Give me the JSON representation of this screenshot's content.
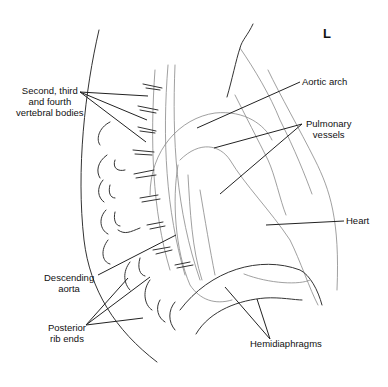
{
  "diagram": {
    "orientation_marker": "L",
    "labels": {
      "vertebral_bodies": [
        "Second, third",
        "and fourth",
        "vertebral bodies"
      ],
      "aortic_arch": "Aortic arch",
      "pulmonary_vessels": [
        "Pulmonary",
        "vessels"
      ],
      "heart": "Heart",
      "descending_aorta": [
        "Descending",
        "aorta"
      ],
      "posterior_rib_ends": [
        "Posterior",
        "rib ends"
      ],
      "hemidiaphragms": "Hemidiaphragms"
    }
  }
}
